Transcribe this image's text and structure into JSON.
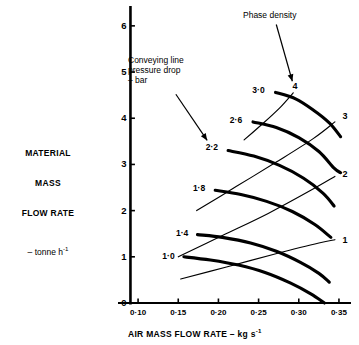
{
  "chart_data": {
    "type": "line",
    "title": "",
    "xlabel": "AIR MASS FLOW RATE – kg s-1",
    "ylabel": "MATERIAL MASS FLOW RATE – tonne h-1",
    "xlim": [
      0.075,
      0.365
    ],
    "ylim": [
      0,
      6.3
    ],
    "xticks": [
      0.1,
      0.15,
      0.2,
      0.25,
      0.3,
      0.35
    ],
    "xtick_labels": [
      "0·10",
      "0·15",
      "0·20",
      "0·25",
      "0·30",
      "0·35"
    ],
    "yticks": [
      0,
      1,
      2,
      3,
      4,
      5,
      6
    ],
    "ytick_labels": [
      "0",
      "1",
      "2",
      "3",
      "4",
      "5",
      "6"
    ],
    "grid": false,
    "legend": "none",
    "annotations": [
      {
        "name": "conveying-line-pressure-drop",
        "lines": [
          "Conveying line",
          "pressure drop",
          "– bar"
        ],
        "arrow_from": [
          0.147,
          4.52
        ],
        "arrow_to": [
          0.186,
          3.52
        ]
      },
      {
        "name": "phase-density",
        "lines": [
          "Phase density"
        ],
        "arrow_from": [
          0.272,
          6.03
        ],
        "arrow_to": [
          0.292,
          4.8
        ]
      }
    ],
    "series": [
      {
        "name": "pressure-drop-1.0",
        "kind": "pressure-drop",
        "label": "1·0",
        "units": "bar",
        "style": "thick",
        "label_at": [
          0.148,
          1.0
        ],
        "points": [
          [
            0.157,
            1.0
          ],
          [
            0.19,
            0.93
          ],
          [
            0.225,
            0.82
          ],
          [
            0.258,
            0.66
          ],
          [
            0.29,
            0.43
          ],
          [
            0.315,
            0.2
          ],
          [
            0.332,
            0.0
          ]
        ]
      },
      {
        "name": "pressure-drop-1.4",
        "kind": "pressure-drop",
        "label": "1·4",
        "units": "bar",
        "style": "thick",
        "label_at": [
          0.165,
          1.5
        ],
        "points": [
          [
            0.174,
            1.48
          ],
          [
            0.205,
            1.42
          ],
          [
            0.24,
            1.3
          ],
          [
            0.272,
            1.12
          ],
          [
            0.302,
            0.88
          ],
          [
            0.325,
            0.64
          ],
          [
            0.338,
            0.45
          ]
        ]
      },
      {
        "name": "pressure-drop-1.8",
        "kind": "pressure-drop",
        "label": "1·8",
        "units": "bar",
        "style": "thick",
        "label_at": [
          0.186,
          2.47
        ],
        "points": [
          [
            0.196,
            2.44
          ],
          [
            0.228,
            2.35
          ],
          [
            0.26,
            2.2
          ],
          [
            0.292,
            1.98
          ],
          [
            0.32,
            1.7
          ],
          [
            0.34,
            1.42
          ]
        ]
      },
      {
        "name": "pressure-drop-2.2",
        "kind": "pressure-drop",
        "label": "2·2",
        "units": "bar",
        "style": "thick",
        "label_at": [
          0.202,
          3.35
        ],
        "points": [
          [
            0.212,
            3.3
          ],
          [
            0.244,
            3.18
          ],
          [
            0.276,
            2.98
          ],
          [
            0.306,
            2.7
          ],
          [
            0.33,
            2.38
          ],
          [
            0.344,
            2.1
          ]
        ]
      },
      {
        "name": "pressure-drop-2.6",
        "kind": "pressure-drop",
        "label": "2·6",
        "units": "bar",
        "style": "thick",
        "label_at": [
          0.232,
          3.95
        ],
        "points": [
          [
            0.243,
            3.92
          ],
          [
            0.272,
            3.8
          ],
          [
            0.3,
            3.58
          ],
          [
            0.325,
            3.28
          ],
          [
            0.344,
            2.92
          ],
          [
            0.352,
            2.82
          ]
        ]
      },
      {
        "name": "pressure-drop-3.0",
        "kind": "pressure-drop",
        "label": "3·0",
        "units": "bar",
        "style": "thick",
        "label_at": [
          0.26,
          4.6
        ],
        "points": [
          [
            0.271,
            4.56
          ],
          [
            0.296,
            4.42
          ],
          [
            0.318,
            4.18
          ],
          [
            0.338,
            3.9
          ],
          [
            0.352,
            3.6
          ]
        ]
      },
      {
        "name": "phase-density-1",
        "kind": "phase-density",
        "label": "1",
        "style": "thin",
        "label_at": [
          0.352,
          1.35
        ],
        "points": [
          [
            0.153,
            0.52
          ],
          [
            0.21,
            0.78
          ],
          [
            0.268,
            1.05
          ],
          [
            0.325,
            1.3
          ],
          [
            0.345,
            1.37
          ]
        ]
      },
      {
        "name": "phase-density-2",
        "kind": "phase-density",
        "label": "2",
        "style": "thin",
        "label_at": [
          0.352,
          2.78
        ],
        "points": [
          [
            0.15,
            1.0
          ],
          [
            0.205,
            1.46
          ],
          [
            0.262,
            1.94
          ],
          [
            0.315,
            2.44
          ],
          [
            0.345,
            2.74
          ]
        ]
      },
      {
        "name": "phase-density-3",
        "kind": "phase-density",
        "label": "3",
        "style": "thin",
        "label_at": [
          0.352,
          4.02
        ],
        "points": [
          [
            0.173,
            2.0
          ],
          [
            0.222,
            2.52
          ],
          [
            0.272,
            3.05
          ],
          [
            0.318,
            3.56
          ],
          [
            0.345,
            3.92
          ]
        ]
      },
      {
        "name": "phase-density-4",
        "kind": "phase-density",
        "label": "4",
        "style": "thin",
        "label_at": [
          0.296,
          4.68
        ],
        "points": [
          [
            0.232,
            3.53
          ],
          [
            0.255,
            3.88
          ],
          [
            0.276,
            4.22
          ],
          [
            0.293,
            4.55
          ]
        ]
      }
    ]
  },
  "y_axis_caption": {
    "line1": "MATERIAL",
    "line2": "MASS",
    "line3": "FLOW RATE",
    "unit_prefix": "– tonne h",
    "unit_exponent": "-1"
  },
  "x_axis_caption": {
    "text_prefix": "AIR MASS FLOW RATE – kg s",
    "text_exponent": "-1"
  }
}
